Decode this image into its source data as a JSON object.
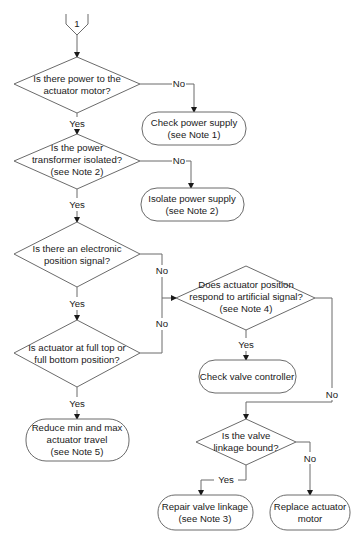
{
  "connector": {
    "label": "1"
  },
  "decisions": [
    {
      "id": "d1",
      "lines": [
        "Is there power to the",
        "actuator motor?"
      ]
    },
    {
      "id": "d2",
      "lines": [
        "Is the power",
        "transformer isolated?",
        "(see Note 2)"
      ]
    },
    {
      "id": "d3",
      "lines": [
        "Is there an electronic",
        "position signal?"
      ]
    },
    {
      "id": "d4",
      "lines": [
        "Is actuator at full top or",
        "full bottom position?"
      ]
    },
    {
      "id": "d5",
      "lines": [
        "Does actuator position",
        "respond to artificial signal?",
        "(see Note 4)"
      ]
    },
    {
      "id": "d6",
      "lines": [
        "Is the valve",
        "linkage bound?"
      ]
    }
  ],
  "actions": [
    {
      "id": "a1",
      "lines": [
        "Check power supply",
        "(see Note 1)"
      ]
    },
    {
      "id": "a2",
      "lines": [
        "Isolate power supply",
        "(see Note 2)"
      ]
    },
    {
      "id": "a3",
      "lines": [
        "Reduce min and max",
        "actuator travel",
        "(see Note 5)"
      ]
    },
    {
      "id": "a4",
      "lines": [
        "Check valve controller"
      ]
    },
    {
      "id": "a5",
      "lines": [
        "Repair valve linkage",
        "(see Note 3)"
      ]
    },
    {
      "id": "a6",
      "lines": [
        "Replace actuator",
        "motor"
      ]
    }
  ],
  "labels": {
    "yes": "Yes",
    "no": "No"
  },
  "colors": {
    "stroke": "#6b6b6b",
    "text": "#1a1a1a",
    "background": "#ffffff"
  }
}
